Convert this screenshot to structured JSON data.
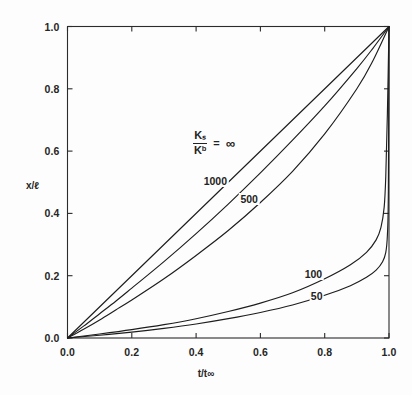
{
  "chart_data": {
    "type": "line",
    "title": "",
    "xlabel": "t/t∞",
    "ylabel": "x/ℓ",
    "xlim": [
      0,
      1
    ],
    "ylim": [
      0,
      1
    ],
    "xticks": [
      "0.0",
      "0.2",
      "0.4",
      "0.6",
      "0.8",
      "1.0"
    ],
    "xtick_values": [
      0,
      0.2,
      0.4,
      0.6,
      0.8,
      1.0
    ],
    "yticks": [
      "0.0",
      "0.2",
      "0.4",
      "0.6",
      "0.8",
      "1.0"
    ],
    "ytick_values": [
      0,
      0.2,
      0.4,
      0.6,
      0.8,
      1.0
    ],
    "grid": false,
    "legend_position": "inside-center",
    "legend_title_numerator": "Kₛ",
    "legend_title_denominator": "Kᵇ",
    "legend_title_equals": "=",
    "legend_title_value": "∞",
    "series": [
      {
        "name": "∞",
        "label": "Kₛ/Kᵇ = ∞",
        "label_x": 0.41,
        "label_y": 0.64,
        "x": [
          0.0,
          0.1,
          0.2,
          0.3,
          0.4,
          0.5,
          0.6,
          0.7,
          0.8,
          0.9,
          1.0
        ],
        "y": [
          0.0,
          0.1,
          0.2,
          0.3,
          0.4,
          0.5,
          0.6,
          0.7,
          0.8,
          0.9,
          1.0
        ]
      },
      {
        "name": "1000",
        "label": "1000",
        "label_x": 0.46,
        "label_y": 0.505,
        "x": [
          0.0,
          0.05,
          0.1,
          0.15,
          0.2,
          0.3,
          0.4,
          0.5,
          0.6,
          0.7,
          0.8,
          0.9,
          0.95,
          1.0
        ],
        "y": [
          0.0,
          0.038,
          0.078,
          0.118,
          0.16,
          0.245,
          0.335,
          0.43,
          0.53,
          0.635,
          0.745,
          0.865,
          0.93,
          1.0
        ]
      },
      {
        "name": "500",
        "label": "500",
        "label_x": 0.565,
        "label_y": 0.445,
        "x": [
          0.0,
          0.05,
          0.1,
          0.15,
          0.2,
          0.3,
          0.4,
          0.5,
          0.6,
          0.7,
          0.8,
          0.9,
          0.95,
          1.0
        ],
        "y": [
          0.0,
          0.028,
          0.058,
          0.09,
          0.122,
          0.19,
          0.265,
          0.345,
          0.435,
          0.535,
          0.655,
          0.8,
          0.89,
          1.0
        ]
      },
      {
        "name": "100",
        "label": "100",
        "label_x": 0.765,
        "label_y": 0.205,
        "x": [
          0.0,
          0.1,
          0.2,
          0.3,
          0.4,
          0.5,
          0.6,
          0.7,
          0.8,
          0.88,
          0.93,
          0.96,
          0.975,
          0.985,
          0.99,
          0.995,
          1.0
        ],
        "y": [
          0.0,
          0.013,
          0.027,
          0.043,
          0.062,
          0.085,
          0.112,
          0.145,
          0.19,
          0.235,
          0.275,
          0.315,
          0.355,
          0.42,
          0.52,
          0.72,
          1.0
        ]
      },
      {
        "name": "50",
        "label": "50",
        "label_x": 0.775,
        "label_y": 0.135,
        "x": [
          0.0,
          0.1,
          0.2,
          0.3,
          0.4,
          0.5,
          0.6,
          0.7,
          0.8,
          0.88,
          0.93,
          0.96,
          0.98,
          0.99,
          0.995,
          0.998,
          1.0
        ],
        "y": [
          0.0,
          0.009,
          0.019,
          0.031,
          0.045,
          0.062,
          0.082,
          0.106,
          0.137,
          0.168,
          0.195,
          0.218,
          0.245,
          0.275,
          0.33,
          0.47,
          1.0
        ]
      }
    ],
    "colors": {
      "curve": "#1d1d1d",
      "axis": "#2b2b2b",
      "background": "#fdfdfd"
    }
  }
}
